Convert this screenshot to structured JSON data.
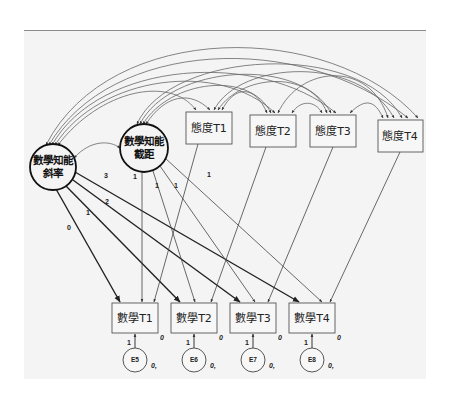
{
  "diagram": {
    "type": "latent growth curve model (SEM path diagram)",
    "latents": [
      {
        "id": "slope",
        "label_line1": "數學知能",
        "label_line2": "斜率"
      },
      {
        "id": "intercept",
        "label_line1": "數學知能",
        "label_line2": "截距"
      }
    ],
    "covariates": [
      {
        "id": "att1",
        "label": "態度T1"
      },
      {
        "id": "att2",
        "label": "態度T2"
      },
      {
        "id": "att3",
        "label": "態度T3"
      },
      {
        "id": "att4",
        "label": "態度T4"
      }
    ],
    "indicators": [
      {
        "id": "math1",
        "label": "數學T1",
        "intercept": "0"
      },
      {
        "id": "math2",
        "label": "數學T2",
        "intercept": "0"
      },
      {
        "id": "math3",
        "label": "數學T3",
        "intercept": "0"
      },
      {
        "id": "math4",
        "label": "數學T4",
        "intercept": "0"
      }
    ],
    "errors": [
      {
        "id": "E5",
        "label": "E5",
        "param": "0,",
        "loading": "1"
      },
      {
        "id": "E6",
        "label": "E6",
        "param": "0,",
        "loading": "1"
      },
      {
        "id": "E7",
        "label": "E7",
        "param": "0,",
        "loading": "1"
      },
      {
        "id": "E8",
        "label": "E8",
        "param": "0,",
        "loading": "1"
      }
    ],
    "slope_loadings": [
      "0",
      "1",
      "2",
      "3"
    ],
    "intercept_loadings": [
      "1",
      "1",
      "1",
      "1"
    ]
  }
}
